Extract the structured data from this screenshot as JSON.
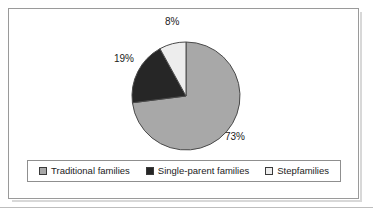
{
  "chart_data": {
    "type": "pie",
    "title": "",
    "subtitle": "",
    "categories": [
      "Traditional families",
      "Single-parent families",
      "Stepfamilies"
    ],
    "values": [
      73,
      19,
      8
    ],
    "value_unit": "%",
    "data_labels": [
      "73%",
      "19%",
      "8%"
    ],
    "colors": [
      "#a8a8a8",
      "#262626",
      "#ededed"
    ],
    "slice_border_color": "#4a4a4a",
    "start_angle_deg": 0,
    "direction": "clockwise",
    "legend_position": "bottom",
    "grid": false,
    "xlabel": "",
    "ylabel": "",
    "slices": [
      {
        "label": "Traditional families",
        "value": 73,
        "data_label": "73%",
        "color": "#a8a8a8",
        "start_deg": 0,
        "end_deg": 262.8
      },
      {
        "label": "Single-parent families",
        "value": 19,
        "data_label": "19%",
        "color": "#262626",
        "start_deg": 262.8,
        "end_deg": 331.2
      },
      {
        "label": "Stepfamilies",
        "value": 8,
        "data_label": "8%",
        "color": "#ededed",
        "start_deg": 331.2,
        "end_deg": 360
      }
    ]
  },
  "labels": {
    "traditional_pct": "73%",
    "single_parent_pct": "19%",
    "stepfamilies_pct": "8%"
  },
  "legend": {
    "items": [
      {
        "label": "Traditional families",
        "color": "#a8a8a8"
      },
      {
        "label": "Single-parent families",
        "color": "#262626"
      },
      {
        "label": "Stepfamilies",
        "color": "#ededed"
      }
    ]
  }
}
